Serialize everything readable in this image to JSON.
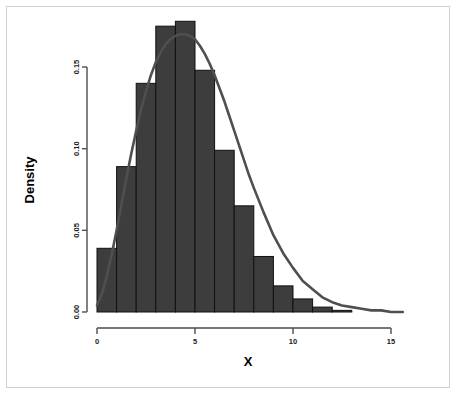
{
  "chart_data": {
    "type": "bar",
    "title": "",
    "subtitle": "",
    "xlabel": "X",
    "ylabel": "Density",
    "xlim": [
      -0.4,
      16.0
    ],
    "ylim": [
      0.0,
      0.185
    ],
    "grid": false,
    "legend": null,
    "bin_width": 1,
    "bar_fill_color": "#3d3d3d",
    "bar_border_color": "#111111",
    "curve_color": "#4f4f4f",
    "axis_color": "#4d4d4d",
    "background_color": "#ffffff",
    "border_color": "#cfcfcf",
    "xticks": [
      0,
      5,
      10,
      15
    ],
    "xtick_labels": [
      "0",
      "5",
      "10",
      "15"
    ],
    "yticks": [
      0.0,
      0.05,
      0.1,
      0.15
    ],
    "ytick_labels": [
      "0.00",
      "0.05",
      "0.10",
      "0.15"
    ],
    "categories": [
      "0-1",
      "1-2",
      "2-3",
      "3-4",
      "4-5",
      "5-6",
      "6-7",
      "7-8",
      "8-9",
      "9-10",
      "10-11",
      "11-12",
      "12-13"
    ],
    "bin_edges": [
      0,
      1,
      2,
      3,
      4,
      5,
      6,
      7,
      8,
      9,
      10,
      11,
      12,
      13
    ],
    "values": [
      0.039,
      0.089,
      0.14,
      0.175,
      0.178,
      0.148,
      0.099,
      0.065,
      0.034,
      0.016,
      0.008,
      0.003,
      0.001
    ],
    "series": [
      {
        "name": "Histogram density",
        "type": "bar",
        "values": [
          0.039,
          0.089,
          0.14,
          0.175,
          0.178,
          0.148,
          0.099,
          0.065,
          0.034,
          0.016,
          0.008,
          0.003,
          0.001
        ]
      },
      {
        "name": "Fitted density curve",
        "type": "line",
        "x": [
          0.0,
          0.25,
          0.5,
          0.75,
          1.0,
          1.25,
          1.5,
          1.75,
          2.0,
          2.25,
          2.5,
          2.75,
          3.0,
          3.25,
          3.5,
          3.75,
          4.0,
          4.25,
          4.5,
          4.75,
          5.0,
          5.25,
          5.5,
          5.75,
          6.0,
          6.25,
          6.5,
          6.75,
          7.0,
          7.25,
          7.5,
          7.75,
          8.0,
          8.5,
          9.0,
          9.5,
          10.0,
          10.5,
          11.0,
          11.5,
          12.0,
          12.5,
          13.0,
          13.5,
          14.0,
          14.5,
          15.0,
          15.6
        ],
        "y": [
          0.004,
          0.011,
          0.022,
          0.035,
          0.05,
          0.066,
          0.082,
          0.097,
          0.111,
          0.124,
          0.135,
          0.145,
          0.153,
          0.159,
          0.164,
          0.167,
          0.169,
          0.17,
          0.17,
          0.169,
          0.167,
          0.163,
          0.158,
          0.152,
          0.145,
          0.137,
          0.129,
          0.12,
          0.111,
          0.102,
          0.093,
          0.084,
          0.076,
          0.061,
          0.047,
          0.036,
          0.027,
          0.019,
          0.014,
          0.009,
          0.006,
          0.004,
          0.003,
          0.002,
          0.001,
          0.001,
          0.0,
          0.0
        ]
      }
    ]
  },
  "axes": {
    "x_axis_label": "X",
    "y_axis_label": "Density",
    "x_tick_0": "0",
    "x_tick_1": "5",
    "x_tick_2": "10",
    "x_tick_3": "15",
    "y_tick_0": "0.00",
    "y_tick_1": "0.05",
    "y_tick_2": "0.10",
    "y_tick_3": "0.15"
  }
}
